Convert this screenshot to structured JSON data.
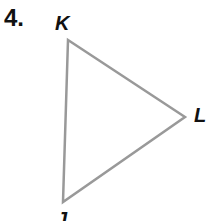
{
  "problem": {
    "number": "4.",
    "shape": "triangle",
    "vertices": [
      {
        "label": "K",
        "x": 68,
        "y": 40
      },
      {
        "label": "L",
        "x": 185,
        "y": 117
      },
      {
        "label": "J",
        "x": 63,
        "y": 202
      }
    ],
    "stroke_color": "#999999"
  }
}
